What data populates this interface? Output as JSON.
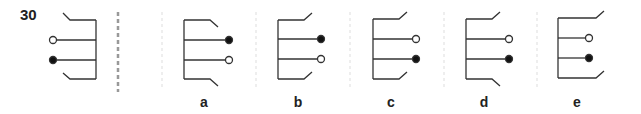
{
  "question": {
    "number": "30"
  },
  "options": [
    {
      "label": "a"
    },
    {
      "label": "b"
    },
    {
      "label": "c"
    },
    {
      "label": "d"
    },
    {
      "label": "e"
    }
  ],
  "colors": {
    "stroke": "#333333",
    "divider_main": "#999999",
    "divider_light": "#dddddd"
  }
}
